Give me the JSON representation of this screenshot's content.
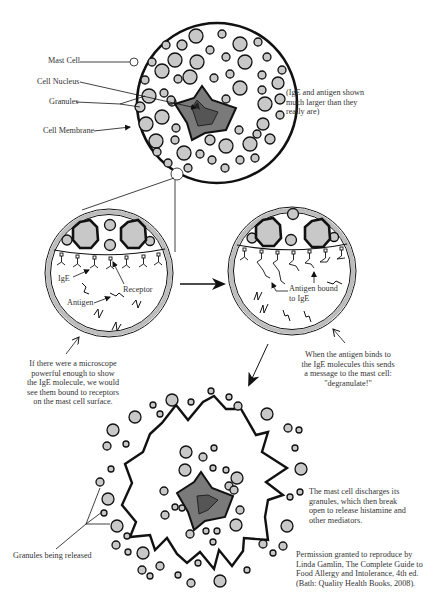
{
  "diagram": {
    "colors": {
      "outline": "#111111",
      "granule_fill": "#c8c8c8",
      "nucleus_outer": "#7a7a7a",
      "nucleus_inner": "#555555",
      "membrane_ring": "#bdbdbd",
      "background": "#ffffff",
      "text": "#333333"
    },
    "panels": {
      "top_cell": {
        "labels": {
          "mast_cell": "Mast Cell",
          "cell_nucleus": "Cell Nucleus",
          "granules": "Granules",
          "cell_membrane": "Cell Membrane"
        },
        "note": [
          "(IgE and antigen shown",
          "much larger than they",
          "really are)"
        ]
      },
      "zoom_left": {
        "labels": {
          "ige": "IgE",
          "receptor": "Receptor",
          "antigen": "Antigen"
        },
        "caption": [
          "If there were a microscope",
          "powerful enough to show",
          "the IgE molecule, we would",
          "see them bound to receptors",
          "on the mast cell surface."
        ]
      },
      "zoom_right": {
        "labels": {
          "antigen_bound": [
            "Antigen bound",
            "to IgE"
          ]
        },
        "caption": [
          "When the antigen binds to",
          "the IgE molecules this sends",
          "a message to the mast cell:",
          "\"degranulate!\""
        ]
      },
      "degranulating_cell": {
        "labels": {
          "granules_released": "Granules being released"
        },
        "caption": [
          "The mast cell discharges its",
          "granules, which then break",
          "open to release histamine and",
          "other mediators."
        ]
      }
    },
    "credit": [
      "Permission granted to reproduce by",
      "Linda Gamlin, The Complete Guide to",
      "Food Allergy and Intolerance, 4th ed.",
      "(Bath: Quality Health Books, 2008)."
    ]
  }
}
